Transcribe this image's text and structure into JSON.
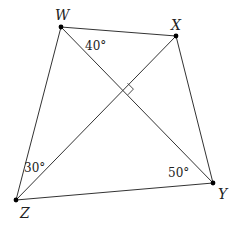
{
  "diagram": {
    "type": "quadrilateral-with-diagonals",
    "vertices": [
      {
        "name": "W",
        "x": 61,
        "y": 27,
        "label_x": 55,
        "label_y": 20
      },
      {
        "name": "X",
        "x": 176,
        "y": 36,
        "label_x": 171,
        "label_y": 30
      },
      {
        "name": "Y",
        "x": 213,
        "y": 183,
        "label_x": 218,
        "label_y": 199
      },
      {
        "name": "Z",
        "x": 16,
        "y": 200,
        "label_x": 20,
        "label_y": 218
      }
    ],
    "sides": [
      [
        "W",
        "X"
      ],
      [
        "X",
        "Y"
      ],
      [
        "Y",
        "Z"
      ],
      [
        "Z",
        "W"
      ]
    ],
    "diagonals": [
      [
        "W",
        "Y"
      ],
      [
        "X",
        "Z"
      ]
    ],
    "right_angle_at_intersection": true,
    "angles": [
      {
        "label": "40°",
        "at": "W",
        "x": 85,
        "y": 50
      },
      {
        "label": "30°",
        "at": "Z",
        "x": 24,
        "y": 172
      },
      {
        "label": "50°",
        "at": "Y",
        "x": 168,
        "y": 177
      }
    ],
    "line_color": "#333333",
    "point_color": "#000000"
  }
}
